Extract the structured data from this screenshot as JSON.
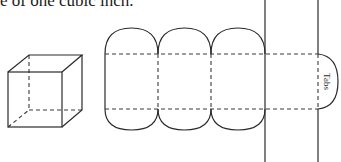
{
  "caption": "e of one cubic inch.",
  "cube": {
    "label": "cube-wireframe"
  },
  "net": {
    "panels": 4,
    "tab_label": "Tabs"
  }
}
